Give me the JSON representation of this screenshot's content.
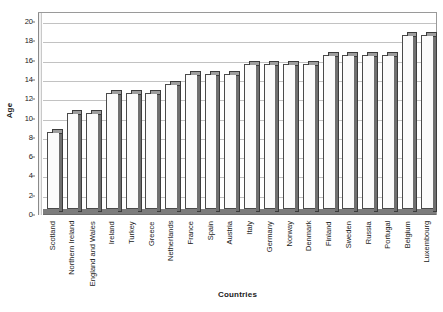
{
  "chart_data": {
    "type": "bar",
    "title": "",
    "xlabel": "Countries",
    "ylabel": "Age",
    "ylim": [
      0,
      20
    ],
    "yticks": [
      0,
      2,
      4,
      6,
      8,
      10,
      12,
      14,
      16,
      18,
      20
    ],
    "ytick_labels": [
      "0",
      "2",
      "4",
      "6",
      "8",
      "10",
      "12",
      "14",
      "16",
      "18",
      "20"
    ],
    "grid": true,
    "legend": false,
    "legend_position": "none",
    "style": "3d-column",
    "bar_face_color": "#fbfbfb",
    "bar_edge_color": "#4a4a4a",
    "bar_side_color": "#6f6f6f",
    "bar_top_color": "#9d9d9d",
    "gridline_color": "#c2c2c2",
    "plot_background": "#ffffff",
    "categories": [
      "Scotland",
      "Northern Ireland",
      "England and Wales",
      "Ireland",
      "Turkey",
      "Greece",
      "Netherlands",
      "France",
      "Spain",
      "Austria",
      "Italy",
      "Germany",
      "Norway",
      "Denmark",
      "Finland",
      "Sweden",
      "Russia",
      "Portugal",
      "Belgium",
      "Luxembourg"
    ],
    "values": [
      8,
      10,
      10,
      12,
      12,
      12,
      13,
      14,
      14,
      14,
      15,
      15,
      15,
      15,
      16,
      16,
      16,
      16,
      18,
      18
    ]
  }
}
